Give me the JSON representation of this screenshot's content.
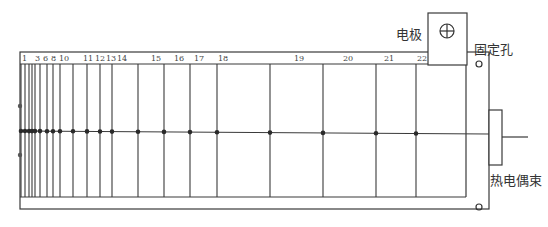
{
  "diagram": {
    "colors": {
      "line": "#3a3a3a",
      "background": "#ffffff",
      "dot": "#2a2a2a"
    },
    "labels": {
      "electrode": "电极",
      "fixing_hole": "固定孔",
      "thermocouple_bundle": "热电偶束"
    },
    "electrode_symbol": "crosshair-circle-icon",
    "thermocouples": [
      {
        "id": "1",
        "x": 21,
        "label": "1"
      },
      {
        "id": "2",
        "x": 25,
        "label": ""
      },
      {
        "id": "3",
        "x": 29,
        "label": "3"
      },
      {
        "id": "4",
        "x": 32,
        "label": ""
      },
      {
        "id": "5",
        "x": 35,
        "label": ""
      },
      {
        "id": "6",
        "x": 40,
        "label": "6"
      },
      {
        "id": "7",
        "x": 47,
        "label": ""
      },
      {
        "id": "8",
        "x": 53,
        "label": "8"
      },
      {
        "id": "10",
        "x": 60,
        "label": "10"
      },
      {
        "id": "11",
        "x": 73,
        "label": "11"
      },
      {
        "id": "12",
        "x": 87,
        "label": "12"
      },
      {
        "id": "13",
        "x": 100,
        "label": "13"
      },
      {
        "id": "14",
        "x": 112,
        "label": "14"
      },
      {
        "id": "15",
        "x": 138,
        "label": "15"
      },
      {
        "id": "16",
        "x": 164,
        "label": "16"
      },
      {
        "id": "17",
        "x": 190,
        "label": "17"
      },
      {
        "id": "18",
        "x": 217,
        "label": "18"
      },
      {
        "id": "19",
        "x": 270,
        "label": "19"
      },
      {
        "id": "20",
        "x": 323,
        "label": "20"
      },
      {
        "id": "21",
        "x": 376,
        "label": "21"
      },
      {
        "id": "22",
        "x": 416,
        "label": "22"
      }
    ],
    "number_labels": [
      {
        "text": "1",
        "x": 22
      },
      {
        "text": "3",
        "x": 35
      },
      {
        "text": "6",
        "x": 43
      },
      {
        "text": "8",
        "x": 51
      },
      {
        "text": "10",
        "x": 59
      },
      {
        "text": "11",
        "x": 83
      },
      {
        "text": "12",
        "x": 95
      },
      {
        "text": "13",
        "x": 106
      },
      {
        "text": "14",
        "x": 117
      },
      {
        "text": "15",
        "x": 151
      },
      {
        "text": "16",
        "x": 174
      },
      {
        "text": "17",
        "x": 194
      },
      {
        "text": "18",
        "x": 218
      },
      {
        "text": "19",
        "x": 294
      },
      {
        "text": "20",
        "x": 343
      },
      {
        "text": "21",
        "x": 384
      },
      {
        "text": "22",
        "x": 417
      }
    ]
  }
}
